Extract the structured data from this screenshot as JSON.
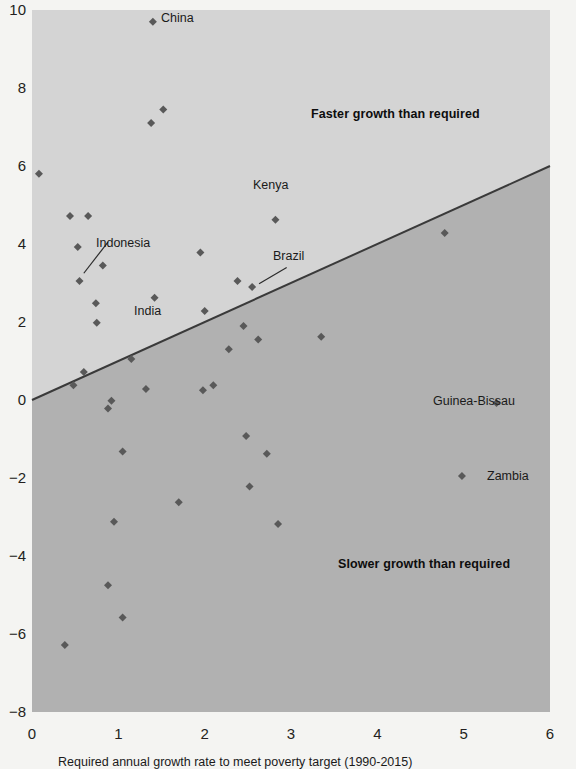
{
  "chart_data": {
    "type": "scatter",
    "title": "",
    "xlabel": "Required annual growth rate to meet poverty target (1990-2015)",
    "ylabel": "",
    "xlim": [
      0,
      6
    ],
    "ylim": [
      -8,
      10
    ],
    "xticks": [
      "0",
      "1",
      "2",
      "3",
      "4",
      "5",
      "6"
    ],
    "yticks": [
      "10",
      "8",
      "6",
      "4",
      "2",
      "0",
      "-2",
      "-4",
      "-6",
      "-8"
    ],
    "grid": false,
    "legend": "none",
    "reference_line": {
      "name": "equal-growth-line",
      "from": [
        0,
        0
      ],
      "to": [
        6,
        6
      ],
      "color": "#3a3a3a",
      "description": "y = x, separates faster vs slower growth than required"
    },
    "regions": [
      {
        "name": "faster-growth-region",
        "label": "Faster growth than required",
        "color": "#d4d4d4"
      },
      {
        "name": "slower-growth-region",
        "label": "Slower growth than required",
        "color": "#b1b1b1"
      }
    ],
    "marker": {
      "shape": "diamond",
      "color": "#595959",
      "size": 8
    },
    "points": [
      {
        "x": 1.4,
        "y": 9.7,
        "label": "China",
        "label_pos": "right"
      },
      {
        "x": 1.52,
        "y": 7.45,
        "label": ""
      },
      {
        "x": 1.38,
        "y": 7.1,
        "label": ""
      },
      {
        "x": 0.08,
        "y": 5.8,
        "label": ""
      },
      {
        "x": 0.44,
        "y": 4.72,
        "label": ""
      },
      {
        "x": 0.65,
        "y": 4.72,
        "label": ""
      },
      {
        "x": 2.82,
        "y": 4.62,
        "label": ""
      },
      {
        "x": 4.78,
        "y": 4.28,
        "label": ""
      },
      {
        "x": 0.53,
        "y": 3.92,
        "label": ""
      },
      {
        "x": 1.95,
        "y": 3.78,
        "label": ""
      },
      {
        "x": 0.82,
        "y": 3.45,
        "label": ""
      },
      {
        "x": 0.55,
        "y": 3.05,
        "label": "Indonesia",
        "label_pos": "leader-up-right"
      },
      {
        "x": 2.38,
        "y": 3.05,
        "label": ""
      },
      {
        "x": 2.55,
        "y": 2.9,
        "label": "Brazil",
        "label_pos": "leader-up-right"
      },
      {
        "x": 1.42,
        "y": 2.62,
        "label": "India",
        "label_pos": "below"
      },
      {
        "x": 0.74,
        "y": 2.48,
        "label": ""
      },
      {
        "x": 2.0,
        "y": 2.28,
        "label": ""
      },
      {
        "x": 0.75,
        "y": 1.98,
        "label": ""
      },
      {
        "x": 2.45,
        "y": 1.9,
        "label": "Kenya",
        "label_pos": "right"
      },
      {
        "x": 2.62,
        "y": 1.55,
        "label": ""
      },
      {
        "x": 3.35,
        "y": 1.62,
        "label": ""
      },
      {
        "x": 2.28,
        "y": 1.3,
        "label": ""
      },
      {
        "x": 1.15,
        "y": 1.05,
        "label": ""
      },
      {
        "x": 0.6,
        "y": 0.72,
        "label": ""
      },
      {
        "x": 2.1,
        "y": 0.38,
        "label": ""
      },
      {
        "x": 1.98,
        "y": 0.25,
        "label": ""
      },
      {
        "x": 1.32,
        "y": 0.28,
        "label": ""
      },
      {
        "x": 0.48,
        "y": 0.38,
        "label": ""
      },
      {
        "x": 0.92,
        "y": -0.02,
        "label": ""
      },
      {
        "x": 0.88,
        "y": -0.22,
        "label": ""
      },
      {
        "x": 5.38,
        "y": -0.08,
        "label": "Guinea-Bissau",
        "label_pos": "left"
      },
      {
        "x": 2.48,
        "y": -0.92,
        "label": ""
      },
      {
        "x": 1.05,
        "y": -1.32,
        "label": ""
      },
      {
        "x": 2.72,
        "y": -1.38,
        "label": ""
      },
      {
        "x": 4.98,
        "y": -1.95,
        "label": "Zambia",
        "label_pos": "right"
      },
      {
        "x": 2.52,
        "y": -2.22,
        "label": ""
      },
      {
        "x": 1.7,
        "y": -2.62,
        "label": ""
      },
      {
        "x": 2.85,
        "y": -3.18,
        "label": ""
      },
      {
        "x": 0.95,
        "y": -3.12,
        "label": ""
      },
      {
        "x": 0.88,
        "y": -4.75,
        "label": ""
      },
      {
        "x": 1.05,
        "y": -5.58,
        "label": ""
      },
      {
        "x": 0.38,
        "y": -6.28,
        "label": ""
      }
    ]
  },
  "axes": {
    "y_ticks": [
      "10",
      "8",
      "6",
      "4",
      "2",
      "0",
      "−2",
      "−4",
      "−6",
      "−8"
    ],
    "x_ticks": [
      "0",
      "1",
      "2",
      "3",
      "4",
      "5",
      "6"
    ]
  },
  "annotations": {
    "faster": "Faster growth than required",
    "slower": "Slower growth than required",
    "china": "China",
    "indonesia": "Indonesia",
    "india": "India",
    "brazil": "Brazil",
    "kenya": "Kenya",
    "guinea_bissau": "Guinea-Bissau",
    "zambia": "Zambia"
  },
  "caption": "Required annual growth rate to meet poverty target (1990-2015)",
  "colors": {
    "region_upper": "#d4d4d4",
    "region_lower": "#b1b1b1",
    "marker": "#595959",
    "line": "#3a3a3a",
    "text": "#231f20",
    "background": "#f4f4f2"
  }
}
